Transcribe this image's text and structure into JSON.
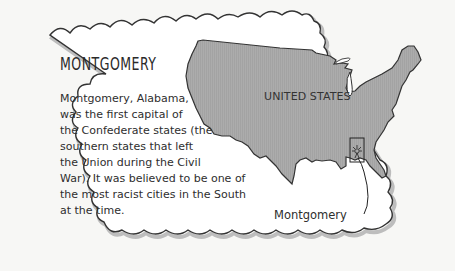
{
  "card": {
    "title": "MONTGOMERY",
    "body_lines": [
      "Montgomery, Alabama,",
      "was the first capital of",
      "the Confederate states (the",
      "southern states that left",
      "the Union during the Civil",
      "War). It was believed to be one of",
      "the most racist cities in the South",
      "at the time."
    ]
  },
  "map": {
    "country_label": "UNITED STATES",
    "city_label": "Montgomery",
    "highlighted_state": "Alabama",
    "marker_icon": "city-marker-icon",
    "colors": {
      "land": "#a9a9a9",
      "outline": "#3a3a3a",
      "frame_shadow": "#b8b8b8",
      "background": "#f7f7f5"
    }
  }
}
